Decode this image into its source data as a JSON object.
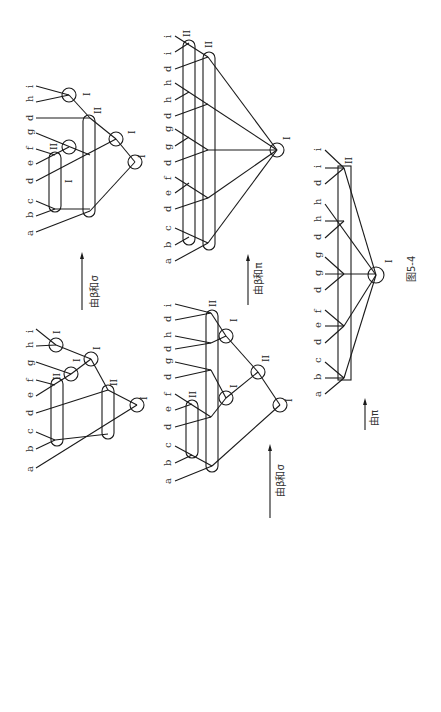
{
  "figure": {
    "caption": "图5-4",
    "arrows": [
      {
        "label": "由β和σ",
        "id": "arrow-1"
      },
      {
        "label": "由β和π",
        "id": "arrow-2"
      },
      {
        "label": "由β和σ",
        "id": "arrow-3"
      },
      {
        "label": "由π",
        "id": "arrow-4"
      }
    ],
    "trees": [
      {
        "id": "tree-a",
        "leaves": [
          "a",
          "b",
          "c",
          "d",
          "e",
          "f",
          "g",
          "d",
          "h",
          "i"
        ]
      },
      {
        "id": "tree-b",
        "leaves": [
          "a",
          "b",
          "c",
          "d",
          "e",
          "f",
          "g",
          "h",
          "i"
        ]
      },
      {
        "id": "tree-c",
        "leaves": [
          "a",
          "b",
          "c",
          "d",
          "e",
          "f",
          "d",
          "g",
          "g",
          "d",
          "h",
          "h",
          "d",
          "i",
          "i"
        ]
      },
      {
        "id": "tree-d",
        "leaves": [
          "a",
          "b",
          "c",
          "d",
          "e",
          "f",
          "d",
          "g",
          "d",
          "h",
          "d",
          "i"
        ]
      },
      {
        "id": "tree-e",
        "leaves": [
          "a",
          "b",
          "c",
          "d",
          "e",
          "f",
          "d",
          "g",
          "g",
          "d",
          "h",
          "h",
          "d",
          "i",
          "i"
        ]
      }
    ],
    "node_labels": {
      "one": "I",
      "two": "II"
    }
  }
}
